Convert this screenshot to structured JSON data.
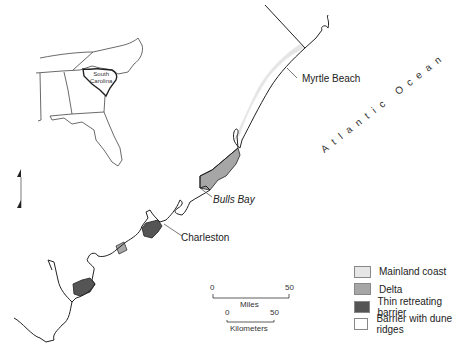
{
  "inset": {
    "state_label_line1": "South",
    "state_label_line2": "Carolina"
  },
  "labels": {
    "myrtle_beach": "Myrtle Beach",
    "bulls_bay": "Bulls Bay",
    "charleston": "Charleston",
    "ocean": "Atlantic Ocean"
  },
  "north_arrow": {
    "symbol": "N"
  },
  "scale_bar": {
    "miles": {
      "start": "0",
      "end": "50",
      "unit": "Miles"
    },
    "kilometers": {
      "start": "0",
      "end": "50",
      "unit": "Kilometers"
    }
  },
  "legend": {
    "items": [
      {
        "label": "Mainland coast",
        "color": "#e6e6e6"
      },
      {
        "label": "Delta",
        "color": "#a6a6a6"
      },
      {
        "label": "Thin retreating barrier",
        "color": "#555555"
      },
      {
        "label": "Barrier with dune ridges",
        "color": "#ffffff"
      }
    ]
  }
}
